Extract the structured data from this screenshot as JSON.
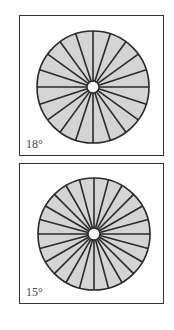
{
  "figure": {
    "fill_color": "#d4d4d4",
    "stroke_color": "#2a2a2a",
    "panels": [
      {
        "label": "18°",
        "angle_deg": 18,
        "spoke_count": 20,
        "box": {
          "top": 15,
          "height": 141
        },
        "wheel": {
          "cx": 73,
          "cy": 71,
          "r": 56,
          "hub_r": 6
        }
      },
      {
        "label": "15°",
        "angle_deg": 15,
        "spoke_count": 24,
        "box": {
          "top": 163,
          "height": 141
        },
        "wheel": {
          "cx": 74,
          "cy": 70,
          "r": 56,
          "hub_r": 6
        }
      }
    ]
  }
}
